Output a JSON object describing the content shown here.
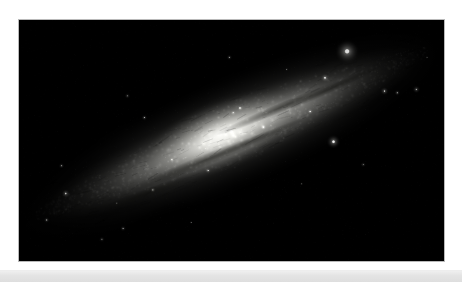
{
  "page": {
    "background_color": "#ffffff",
    "width": 462,
    "height": 282,
    "caption": ""
  },
  "photo": {
    "name": "edge-on-spiral-galaxy",
    "description": "Grayscale astrophotograph of a highly inclined spiral galaxy with a bright elongated core, mottled dust lanes, and a sparse field of foreground stars on a black sky.",
    "frame": {
      "x": 18,
      "y": 19,
      "width": 427,
      "height": 243,
      "border_color": "#b9b9b9",
      "background_color": "#000000"
    },
    "sky_color": "#000000",
    "galaxy_core_color": "#f2f2ee",
    "galaxy_mid_color": "#9a9a96",
    "galaxy_outer_color": "#3a3a3a",
    "dust_lane_color": "#14140f",
    "galaxy": {
      "center_x_pct": 50,
      "center_y_pct": 47,
      "length_pct": 104,
      "width_pct": 30,
      "position_angle_deg": -23
    },
    "stars": [
      {
        "x_pct": 77.2,
        "y_pct": 13.0,
        "radius": 2.6,
        "brightness": 1.0,
        "glow": 9
      },
      {
        "x_pct": 72.0,
        "y_pct": 24.0,
        "radius": 1.1,
        "brightness": 0.72,
        "glow": 3
      },
      {
        "x_pct": 86.0,
        "y_pct": 29.5,
        "radius": 1.0,
        "brightness": 0.66,
        "glow": 3
      },
      {
        "x_pct": 93.5,
        "y_pct": 28.8,
        "radius": 0.9,
        "brightness": 0.6,
        "glow": 3
      },
      {
        "x_pct": 89.0,
        "y_pct": 30.2,
        "radius": 0.8,
        "brightness": 0.55,
        "glow": 2
      },
      {
        "x_pct": 74.0,
        "y_pct": 50.5,
        "radius": 1.7,
        "brightness": 0.86,
        "glow": 5
      },
      {
        "x_pct": 68.5,
        "y_pct": 38.0,
        "radius": 0.9,
        "brightness": 0.58,
        "glow": 2
      },
      {
        "x_pct": 52.0,
        "y_pct": 36.5,
        "radius": 0.9,
        "brightness": 0.62,
        "glow": 2
      },
      {
        "x_pct": 49.5,
        "y_pct": 15.5,
        "radius": 0.7,
        "brightness": 0.42,
        "glow": 2
      },
      {
        "x_pct": 50.4,
        "y_pct": 38.5,
        "radius": 0.7,
        "brightness": 0.45,
        "glow": 2
      },
      {
        "x_pct": 29.5,
        "y_pct": 40.5,
        "radius": 0.8,
        "brightness": 0.5,
        "glow": 2
      },
      {
        "x_pct": 25.5,
        "y_pct": 31.5,
        "radius": 0.7,
        "brightness": 0.4,
        "glow": 2
      },
      {
        "x_pct": 10.0,
        "y_pct": 60.5,
        "radius": 0.8,
        "brightness": 0.48,
        "glow": 2
      },
      {
        "x_pct": 11.0,
        "y_pct": 72.0,
        "radius": 1.1,
        "brightness": 0.66,
        "glow": 3
      },
      {
        "x_pct": 6.5,
        "y_pct": 83.0,
        "radius": 0.9,
        "brightness": 0.52,
        "glow": 2
      },
      {
        "x_pct": 24.5,
        "y_pct": 86.5,
        "radius": 0.8,
        "brightness": 0.45,
        "glow": 2
      },
      {
        "x_pct": 19.5,
        "y_pct": 91.0,
        "radius": 0.7,
        "brightness": 0.4,
        "glow": 2
      },
      {
        "x_pct": 23.0,
        "y_pct": 76.0,
        "radius": 0.6,
        "brightness": 0.35,
        "glow": 1
      },
      {
        "x_pct": 40.5,
        "y_pct": 84.0,
        "radius": 0.6,
        "brightness": 0.34,
        "glow": 1
      },
      {
        "x_pct": 96.0,
        "y_pct": 15.5,
        "radius": 0.6,
        "brightness": 0.32,
        "glow": 1
      },
      {
        "x_pct": 63.0,
        "y_pct": 20.5,
        "radius": 0.6,
        "brightness": 0.33,
        "glow": 1
      },
      {
        "x_pct": 36.0,
        "y_pct": 58.0,
        "radius": 0.7,
        "brightness": 0.52,
        "glow": 2
      },
      {
        "x_pct": 44.5,
        "y_pct": 62.5,
        "radius": 0.7,
        "brightness": 0.55,
        "glow": 2
      },
      {
        "x_pct": 57.5,
        "y_pct": 44.5,
        "radius": 0.7,
        "brightness": 0.6,
        "glow": 2
      },
      {
        "x_pct": 31.5,
        "y_pct": 70.5,
        "radius": 0.7,
        "brightness": 0.5,
        "glow": 2
      },
      {
        "x_pct": 81.0,
        "y_pct": 60.0,
        "radius": 0.6,
        "brightness": 0.42,
        "glow": 2
      },
      {
        "x_pct": 66.5,
        "y_pct": 68.0,
        "radius": 0.6,
        "brightness": 0.38,
        "glow": 1
      }
    ],
    "dust_lanes": [
      {
        "x_pct": 62,
        "y_pct": 36,
        "length_pct": 34,
        "width_pct": 4,
        "angle_deg": -23,
        "opacity": 0.55
      },
      {
        "x_pct": 44,
        "y_pct": 58,
        "length_pct": 40,
        "width_pct": 5,
        "angle_deg": -22,
        "opacity": 0.5
      },
      {
        "x_pct": 74,
        "y_pct": 28,
        "length_pct": 26,
        "width_pct": 3,
        "angle_deg": -25,
        "opacity": 0.45
      },
      {
        "x_pct": 30,
        "y_pct": 72,
        "length_pct": 24,
        "width_pct": 4,
        "angle_deg": -20,
        "opacity": 0.4
      },
      {
        "x_pct": 55,
        "y_pct": 50,
        "length_pct": 30,
        "width_pct": 3,
        "angle_deg": -23,
        "opacity": 0.35
      }
    ]
  },
  "footer": {
    "band_color_top": "#f2f2f2",
    "band_color_bottom": "#dedede",
    "label": ""
  }
}
